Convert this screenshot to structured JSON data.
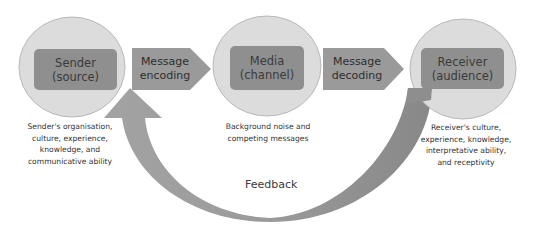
{
  "diagram": {
    "nodes": [
      {
        "id": "sender",
        "line1": "Sender",
        "line2": "(source)",
        "caption": [
          "Sender's organisation,",
          "culture, experience,",
          "knowledge, and",
          "communicative ability"
        ]
      },
      {
        "id": "media",
        "line1": "Media",
        "line2": "(channel)",
        "caption": [
          "Background noise and",
          "competing messages"
        ]
      },
      {
        "id": "receiver",
        "line1": "Receiver",
        "line2": "(audience)",
        "caption": [
          "Receiver's culture,",
          "experience, knowledge,",
          "interpretative ability,",
          "and receptivity"
        ]
      }
    ],
    "arrows": [
      {
        "id": "encoding",
        "line1": "Message",
        "line2": "encoding",
        "from": "sender",
        "to": "media"
      },
      {
        "id": "decoding",
        "line1": "Message",
        "line2": "decoding",
        "from": "media",
        "to": "receiver"
      }
    ],
    "feedback": {
      "label": "Feedback",
      "from": "receiver",
      "to": "sender"
    }
  },
  "colors": {
    "circle_fill": "#dcdcdc",
    "circle_stroke": "#b8b8b8",
    "box_fill": "#8f8f8f",
    "arrow_fill": "#9a9a9a",
    "feedback_fill": "#8e8e8e",
    "text": "#333333"
  }
}
